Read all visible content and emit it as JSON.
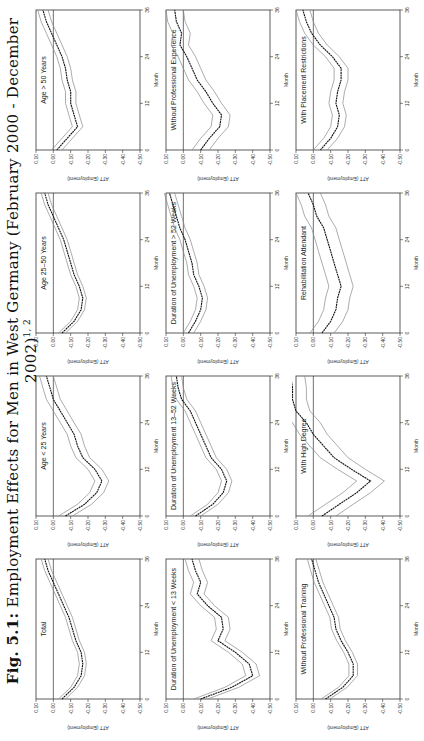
{
  "figure": {
    "label": "Fig. 5.1:",
    "caption": "Employment Effects for Men in West Germany (February 2000 - December 2002)",
    "superscript": "1, 2"
  },
  "chart_data": [
    {
      "type": "line",
      "title": "Total",
      "xlabel": "Month",
      "ylabel": "ATT (Employment)",
      "xticks": [
        0,
        12,
        24,
        36
      ],
      "yticks": [
        0.1,
        0.0,
        -0.1,
        -0.2,
        -0.3,
        -0.4,
        -0.5
      ],
      "ylim": [
        -0.5,
        0.1
      ],
      "x": [
        0,
        3,
        6,
        9,
        12,
        15,
        18,
        21,
        24,
        27,
        30,
        33,
        36
      ],
      "values": [
        -0.05,
        -0.12,
        -0.16,
        -0.17,
        -0.16,
        -0.13,
        -0.11,
        -0.09,
        -0.06,
        -0.03,
        0.0,
        0.03,
        0.05
      ],
      "ci_halfwidth": 0.02
    },
    {
      "type": "line",
      "title": "Age < 25 Years",
      "xlabel": "Month",
      "ylabel": "ATT (Employment)",
      "xticks": [
        0,
        12,
        24,
        36
      ],
      "yticks": [
        0.1,
        0.0,
        -0.1,
        -0.2,
        -0.3,
        -0.4,
        -0.5
      ],
      "ylim": [
        -0.5,
        0.1
      ],
      "x": [
        0,
        3,
        6,
        9,
        12,
        15,
        18,
        21,
        24,
        27,
        30,
        33,
        36
      ],
      "values": [
        -0.07,
        -0.18,
        -0.25,
        -0.28,
        -0.24,
        -0.17,
        -0.14,
        -0.12,
        -0.08,
        -0.04,
        0.0,
        0.02,
        0.04
      ],
      "ci_halfwidth": 0.04
    },
    {
      "type": "line",
      "title": "Age 25–50 Years",
      "xlabel": "Month",
      "ylabel": "ATT (Employment)",
      "xticks": [
        0,
        12,
        24,
        36
      ],
      "yticks": [
        0.1,
        0.0,
        -0.1,
        -0.2,
        -0.3,
        -0.4,
        -0.5
      ],
      "ylim": [
        -0.5,
        0.1
      ],
      "x": [
        0,
        3,
        6,
        9,
        12,
        15,
        18,
        21,
        24,
        27,
        30,
        33,
        36
      ],
      "values": [
        -0.05,
        -0.12,
        -0.16,
        -0.17,
        -0.15,
        -0.12,
        -0.1,
        -0.08,
        -0.06,
        -0.03,
        0.0,
        0.03,
        0.05
      ],
      "ci_halfwidth": 0.02
    },
    {
      "type": "line",
      "title": "Age > 50 Years",
      "xlabel": "Month",
      "ylabel": "ATT (Employment)",
      "xticks": [
        0,
        12,
        24,
        36
      ],
      "yticks": [
        0.1,
        0.0,
        -0.1,
        -0.2,
        -0.3,
        -0.4,
        -0.5
      ],
      "ylim": [
        -0.5,
        0.1
      ],
      "x": [
        0,
        3,
        6,
        9,
        12,
        15,
        18,
        21,
        24,
        27,
        30,
        33,
        36
      ],
      "values": [
        -0.02,
        -0.08,
        -0.14,
        -0.12,
        -0.1,
        -0.1,
        -0.08,
        -0.07,
        -0.05,
        -0.02,
        0.01,
        0.04,
        0.06
      ],
      "ci_halfwidth": 0.03
    },
    {
      "type": "line",
      "title": "Duration of Unemployment < 13 Weeks",
      "xlabel": "Month",
      "ylabel": "ATT (Employment)",
      "xticks": [
        0,
        12,
        24,
        36
      ],
      "yticks": [
        0.1,
        0.0,
        -0.1,
        -0.2,
        -0.3,
        -0.4,
        -0.5
      ],
      "ylim": [
        -0.5,
        0.1
      ],
      "x": [
        0,
        3,
        6,
        9,
        12,
        15,
        18,
        21,
        24,
        27,
        30,
        33,
        36
      ],
      "values": [
        -0.1,
        -0.28,
        -0.4,
        -0.38,
        -0.3,
        -0.2,
        -0.23,
        -0.22,
        -0.14,
        -0.08,
        -0.1,
        -0.07,
        -0.05
      ],
      "ci_halfwidth": 0.04
    },
    {
      "type": "line",
      "title": "Duration of Unemployment 13–52 Weeks",
      "xlabel": "Month",
      "ylabel": "ATT (Employment)",
      "xticks": [
        0,
        12,
        24,
        36
      ],
      "yticks": [
        0.1,
        0.0,
        -0.1,
        -0.2,
        -0.3,
        -0.4,
        -0.5
      ],
      "ylim": [
        -0.5,
        0.1
      ],
      "x": [
        0,
        3,
        6,
        9,
        12,
        15,
        18,
        21,
        24,
        27,
        30,
        33,
        36
      ],
      "values": [
        -0.07,
        -0.17,
        -0.23,
        -0.25,
        -0.22,
        -0.16,
        -0.13,
        -0.1,
        -0.07,
        -0.04,
        0.01,
        0.03,
        0.04
      ],
      "ci_halfwidth": 0.03
    },
    {
      "type": "line",
      "title": "Duration of Unemployment > 52 Weeks",
      "xlabel": "Month",
      "ylabel": "ATT (Employment)",
      "xticks": [
        0,
        12,
        24,
        36
      ],
      "yticks": [
        0.1,
        0.0,
        -0.1,
        -0.2,
        -0.3,
        -0.4,
        -0.5
      ],
      "ylim": [
        -0.5,
        0.1
      ],
      "x": [
        0,
        3,
        6,
        9,
        12,
        15,
        18,
        21,
        24,
        27,
        30,
        33,
        36
      ],
      "values": [
        -0.03,
        -0.07,
        -0.1,
        -0.11,
        -0.09,
        -0.06,
        -0.05,
        -0.03,
        -0.01,
        0.02,
        0.04,
        0.06,
        0.08
      ],
      "ci_halfwidth": 0.03
    },
    {
      "type": "line",
      "title": "Without Professional Experience",
      "xlabel": "Month",
      "ylabel": "ATT (Employment)",
      "xticks": [
        0,
        12,
        24,
        36
      ],
      "yticks": [
        0.1,
        0.0,
        -0.1,
        -0.2,
        -0.3,
        -0.4,
        -0.5
      ],
      "ylim": [
        -0.5,
        0.1
      ],
      "x": [
        0,
        3,
        6,
        9,
        12,
        15,
        18,
        21,
        24,
        27,
        30,
        33,
        36
      ],
      "values": [
        -0.1,
        -0.15,
        -0.21,
        -0.22,
        -0.17,
        -0.13,
        -0.08,
        -0.05,
        -0.02,
        0.02,
        0.01,
        0.04,
        0.05
      ],
      "ci_halfwidth": 0.05
    },
    {
      "type": "line",
      "title": "Without Professional Training",
      "xlabel": "Month",
      "ylabel": "ATT (Employment)",
      "xticks": [
        0,
        12,
        24,
        36
      ],
      "yticks": [
        0.1,
        0.0,
        -0.1,
        -0.2,
        -0.3,
        -0.4,
        -0.5
      ],
      "ylim": [
        -0.5,
        0.1
      ],
      "x": [
        0,
        3,
        6,
        9,
        12,
        15,
        18,
        21,
        24,
        27,
        30,
        33,
        36
      ],
      "values": [
        -0.07,
        -0.17,
        -0.23,
        -0.23,
        -0.2,
        -0.16,
        -0.13,
        -0.12,
        -0.09,
        -0.06,
        -0.03,
        -0.01,
        0.01
      ],
      "ci_halfwidth": 0.025
    },
    {
      "type": "line",
      "title": "With High Degree",
      "xlabel": "Month",
      "ylabel": "ATT (Employment)",
      "xticks": [
        0,
        12,
        24,
        36
      ],
      "yticks": [
        0.1,
        0.0,
        -0.1,
        -0.2,
        -0.3,
        -0.4,
        -0.5
      ],
      "ylim": [
        -0.5,
        0.1
      ],
      "x": [
        0,
        3,
        6,
        9,
        12,
        15,
        18,
        21,
        24,
        27,
        30,
        33,
        36
      ],
      "values": [
        -0.05,
        -0.15,
        -0.25,
        -0.33,
        -0.22,
        -0.12,
        -0.06,
        0.0,
        0.04,
        0.1,
        0.12,
        0.12,
        0.13
      ],
      "ci_halfwidth": 0.08
    },
    {
      "type": "line",
      "title": "Rehabilitation Attendant",
      "xlabel": "Month",
      "ylabel": "ATT (Employment)",
      "xticks": [
        0,
        12,
        24,
        36
      ],
      "yticks": [
        0.1,
        0.0,
        -0.1,
        -0.2,
        -0.3,
        -0.4,
        -0.5
      ],
      "ylim": [
        -0.5,
        0.1
      ],
      "x": [
        0,
        3,
        6,
        9,
        12,
        15,
        18,
        21,
        24,
        27,
        30,
        33,
        36
      ],
      "values": [
        -0.05,
        -0.1,
        -0.13,
        -0.14,
        -0.16,
        -0.14,
        -0.12,
        -0.1,
        -0.08,
        -0.06,
        -0.02,
        0.0,
        0.03
      ],
      "ci_halfwidth": 0.07
    },
    {
      "type": "line",
      "title": "With Placement Restrictions",
      "xlabel": "Month",
      "ylabel": "ATT (Employment)",
      "xticks": [
        0,
        12,
        24,
        36
      ],
      "yticks": [
        0.1,
        0.0,
        -0.1,
        -0.2,
        -0.3,
        -0.4,
        -0.5
      ],
      "ylim": [
        -0.5,
        0.1
      ],
      "x": [
        0,
        3,
        6,
        9,
        12,
        15,
        18,
        21,
        24,
        27,
        30,
        33,
        36
      ],
      "values": [
        -0.04,
        -0.1,
        -0.14,
        -0.15,
        -0.13,
        -0.14,
        -0.16,
        -0.16,
        -0.11,
        -0.04,
        0.01,
        0.04,
        0.06
      ],
      "ci_halfwidth": 0.04
    }
  ]
}
